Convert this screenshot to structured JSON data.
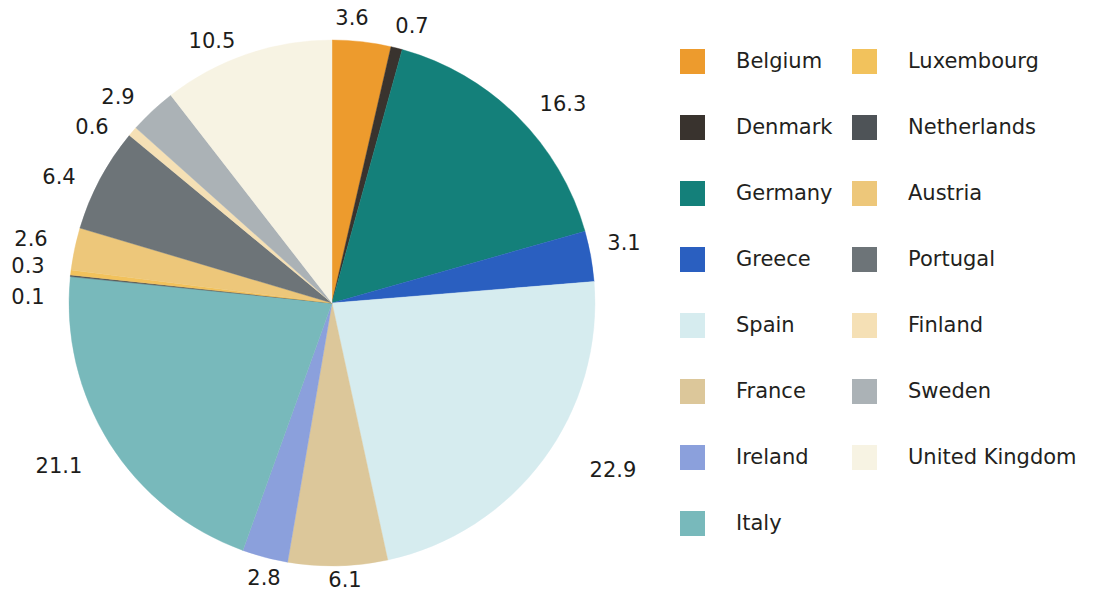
{
  "chart_data": {
    "type": "pie",
    "title": "",
    "legend_position": "right",
    "label_format": "value",
    "start_angle_deg": 0,
    "direction": "clockwise",
    "categories": [
      "Belgium",
      "Denmark",
      "Germany",
      "Greece",
      "Spain",
      "France",
      "Ireland",
      "Italy",
      "Netherlands",
      "Luxembourg",
      "Austria",
      "Portugal",
      "Finland",
      "Sweden",
      "United Kingdom"
    ],
    "values": [
      3.6,
      0.7,
      16.3,
      3.1,
      22.9,
      6.1,
      2.8,
      21.1,
      0.1,
      0.3,
      2.6,
      6.4,
      0.6,
      2.9,
      10.5
    ],
    "total": 100.0,
    "colors": [
      "#ED9B2D",
      "#39332E",
      "#14807A",
      "#2A5FC0",
      "#D6ECEF",
      "#DCC79A",
      "#8BA0DC",
      "#78B9BB",
      "#4E5357",
      "#F2C25C",
      "#EDC77A",
      "#6D7478",
      "#F5E0B5",
      "#ABB2B6",
      "#F7F3E3"
    ],
    "slices": [
      {
        "label": "Belgium",
        "value": 3.6,
        "color": "#ED9B2D"
      },
      {
        "label": "Denmark",
        "value": 0.7,
        "color": "#39332E"
      },
      {
        "label": "Germany",
        "value": 16.3,
        "color": "#14807A"
      },
      {
        "label": "Greece",
        "value": 3.1,
        "color": "#2A5FC0"
      },
      {
        "label": "Spain",
        "value": 22.9,
        "color": "#D6ECEF"
      },
      {
        "label": "France",
        "value": 6.1,
        "color": "#DCC79A"
      },
      {
        "label": "Ireland",
        "value": 2.8,
        "color": "#8BA0DC"
      },
      {
        "label": "Italy",
        "value": 21.1,
        "color": "#78B9BB"
      },
      {
        "label": "Netherlands",
        "value": 0.1,
        "color": "#4E5357"
      },
      {
        "label": "Luxembourg",
        "value": 0.3,
        "color": "#F2C25C"
      },
      {
        "label": "Austria",
        "value": 2.6,
        "color": "#EDC77A"
      },
      {
        "label": "Portugal",
        "value": 6.4,
        "color": "#6D7478"
      },
      {
        "label": "Finland",
        "value": 0.6,
        "color": "#F5E0B5"
      },
      {
        "label": "Sweden",
        "value": 2.9,
        "color": "#ABB2B6"
      },
      {
        "label": "United Kingdom",
        "value": 10.5,
        "color": "#F7F3E3"
      }
    ]
  },
  "pie": {
    "center_x": 332,
    "center_y": 303,
    "radius": 263,
    "data_labels": [
      {
        "text": "3.6",
        "x": 352,
        "y": 18
      },
      {
        "text": "0.7",
        "x": 412,
        "y": 26
      },
      {
        "text": "16.3",
        "x": 563,
        "y": 104
      },
      {
        "text": "3.1",
        "x": 624,
        "y": 243
      },
      {
        "text": "22.9",
        "x": 613,
        "y": 470
      },
      {
        "text": "6.1",
        "x": 345,
        "y": 580
      },
      {
        "text": "2.8",
        "x": 264,
        "y": 578
      },
      {
        "text": "21.1",
        "x": 59,
        "y": 466
      },
      {
        "text": "0.1",
        "x": 28,
        "y": 297
      },
      {
        "text": "0.3",
        "x": 28,
        "y": 266
      },
      {
        "text": "2.6",
        "x": 31,
        "y": 239
      },
      {
        "text": "6.4",
        "x": 59,
        "y": 177
      },
      {
        "text": "0.6",
        "x": 92,
        "y": 127
      },
      {
        "text": "2.9",
        "x": 118,
        "y": 97
      },
      {
        "text": "10.5",
        "x": 212,
        "y": 41
      }
    ]
  },
  "legend": {
    "columns": [
      {
        "name": "left",
        "items": [
          {
            "label": "Belgium",
            "color": "#ED9B2D"
          },
          {
            "label": "Denmark",
            "color": "#39332E"
          },
          {
            "label": "Germany",
            "color": "#14807A"
          },
          {
            "label": "Greece",
            "color": "#2A5FC0"
          },
          {
            "label": "Spain",
            "color": "#D6ECEF"
          },
          {
            "label": "France",
            "color": "#DCC79A"
          },
          {
            "label": "Ireland",
            "color": "#8BA0DC"
          },
          {
            "label": "Italy",
            "color": "#78B9BB"
          }
        ]
      },
      {
        "name": "right",
        "items": [
          {
            "label": "Luxembourg",
            "color": "#F2C25C"
          },
          {
            "label": "Netherlands",
            "color": "#4E5357"
          },
          {
            "label": "Austria",
            "color": "#EDC77A"
          },
          {
            "label": "Portugal",
            "color": "#6D7478"
          },
          {
            "label": "Finland",
            "color": "#F5E0B5"
          },
          {
            "label": "Sweden",
            "color": "#ABB2B6"
          },
          {
            "label": "United Kingdom",
            "color": "#F7F3E3"
          }
        ]
      }
    ]
  }
}
